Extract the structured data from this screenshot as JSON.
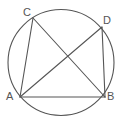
{
  "figure": {
    "name": "cyclic-quadrilateral-diagram",
    "canvas": {
      "width": 118,
      "height": 128
    },
    "background_color": "#ffffff",
    "stroke_color": "#555555",
    "label_color": "#555555",
    "circle": {
      "name": "circumscribed-circle",
      "cx": 61,
      "cy": 62.5,
      "r": 53,
      "stroke_width": 1.1
    },
    "points": [
      {
        "id": "C",
        "label": "C",
        "x": 33,
        "y": 18,
        "label_x": 23,
        "label_y": 7
      },
      {
        "id": "D",
        "label": "D",
        "x": 102,
        "y": 27,
        "label_x": 103,
        "label_y": 15
      },
      {
        "id": "A",
        "label": "A",
        "x": 20,
        "y": 97,
        "label_x": 6,
        "label_y": 91
      },
      {
        "id": "B",
        "label": "B",
        "x": 105,
        "y": 97,
        "label_x": 107,
        "label_y": 91
      }
    ],
    "segments": [
      {
        "id": "CA",
        "from": "C",
        "to": "A",
        "x1": 33,
        "y1": 18,
        "x2": 20,
        "y2": 97,
        "width": 1.1
      },
      {
        "id": "CB",
        "from": "C",
        "to": "B",
        "x1": 33,
        "y1": 18,
        "x2": 105,
        "y2": 97,
        "width": 1.1
      },
      {
        "id": "AD",
        "from": "A",
        "to": "D",
        "x1": 20,
        "y1": 97,
        "x2": 102,
        "y2": 27,
        "width": 1.1
      },
      {
        "id": "AB",
        "from": "A",
        "to": "B",
        "x1": 20,
        "y1": 97,
        "x2": 105,
        "y2": 97,
        "width": 1.1
      },
      {
        "id": "DB",
        "from": "D",
        "to": "B",
        "x1": 102,
        "y1": 27,
        "x2": 105,
        "y2": 97,
        "width": 1.1
      }
    ],
    "intersection": {
      "id": "diagonal-crossing",
      "x": 62,
      "y": 62
    }
  }
}
